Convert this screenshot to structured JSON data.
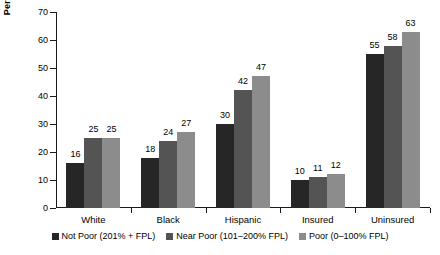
{
  "chart_data": {
    "type": "bar",
    "title": "",
    "xlabel": "",
    "ylabel": "Percentage",
    "ylim": [
      0,
      70
    ],
    "yticks": [
      0,
      10,
      20,
      30,
      40,
      50,
      60,
      70
    ],
    "grid": false,
    "legend_position": "bottom",
    "categories": [
      "White",
      "Black",
      "Hispanic",
      "Insured",
      "Uninsured"
    ],
    "series": [
      {
        "name": "Not Poor (201% + FPL)",
        "color": "#262626",
        "values": [
          16,
          18,
          30,
          10,
          55
        ]
      },
      {
        "name": "Near Poor (101–200% FPL)",
        "color": "#545454",
        "values": [
          25,
          24,
          42,
          11,
          58
        ]
      },
      {
        "name": "Poor (0–100% FPL)",
        "color": "#8c8c8c",
        "values": [
          25,
          27,
          47,
          12,
          63
        ]
      }
    ]
  },
  "axis": {
    "y_title": "Percentage",
    "y_tick_labels": [
      "0",
      "10",
      "20",
      "30",
      "40",
      "50",
      "60",
      "70"
    ]
  },
  "categories": [
    {
      "label": "White"
    },
    {
      "label": "Black"
    },
    {
      "label": "Hispanic"
    },
    {
      "label": "Insured"
    },
    {
      "label": "Uninsured"
    }
  ],
  "legend": [
    {
      "label": "Not Poor (201% + FPL)",
      "color": "#262626"
    },
    {
      "label": "Near Poor (101–200% FPL)",
      "color": "#545454"
    },
    {
      "label": "Poor (0–100% FPL)",
      "color": "#8c8c8c"
    }
  ],
  "values": {
    "white": {
      "not_poor": "16",
      "near_poor": "25",
      "poor": "25"
    },
    "black": {
      "not_poor": "18",
      "near_poor": "24",
      "poor": "27"
    },
    "hispanic": {
      "not_poor": "30",
      "near_poor": "42",
      "poor": "47"
    },
    "insured": {
      "not_poor": "10",
      "near_poor": "11",
      "poor": "12"
    },
    "uninsured": {
      "not_poor": "55",
      "near_poor": "58",
      "poor": "63"
    }
  }
}
